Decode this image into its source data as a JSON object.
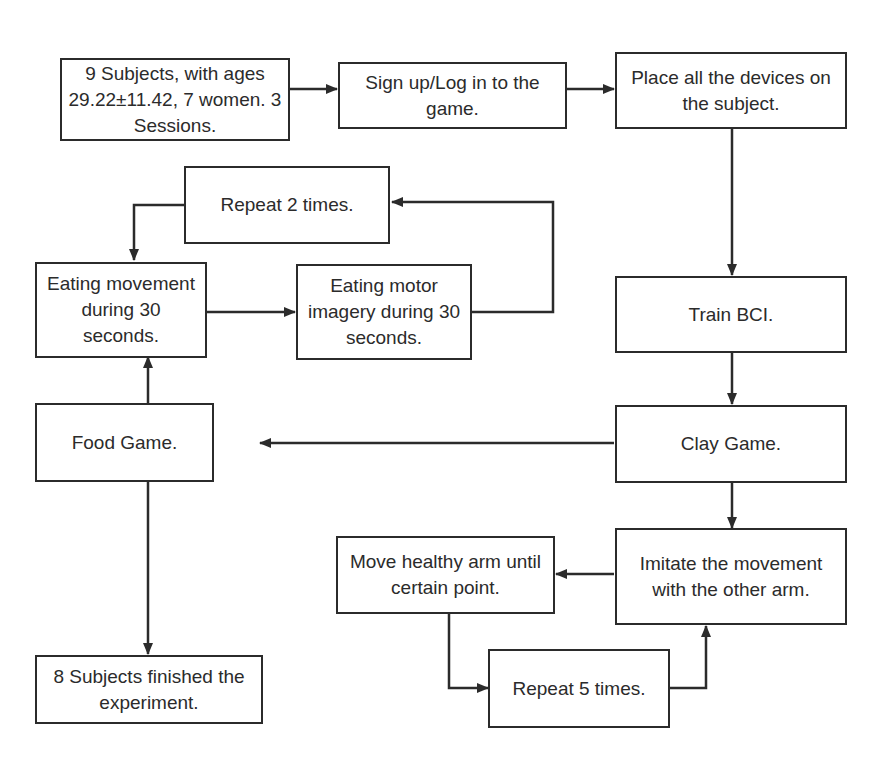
{
  "diagram": {
    "type": "flowchart",
    "nodes": {
      "subjects": "9 Subjects, with ages 29.22±11.42, 7 women. 3 Sessions.",
      "signup": "Sign up/Log in to the game.",
      "devices": "Place all the devices on the subject.",
      "train_bci": "Train BCI.",
      "clay_game": "Clay Game.",
      "imitate": "Imitate the movement with the other arm.",
      "move_arm": "Move healthy arm until certain point.",
      "repeat5": "Repeat 5 times.",
      "food_game": "Food Game.",
      "eating_movement": "Eating movement during 30 seconds.",
      "eating_imagery": "Eating motor imagery during 30 seconds.",
      "repeat2": "Repeat 2 times.",
      "finished": "8 Subjects finished the experiment."
    },
    "edges": [
      [
        "subjects",
        "signup"
      ],
      [
        "signup",
        "devices"
      ],
      [
        "devices",
        "train_bci"
      ],
      [
        "train_bci",
        "clay_game"
      ],
      [
        "clay_game",
        "imitate"
      ],
      [
        "imitate",
        "move_arm"
      ],
      [
        "move_arm",
        "repeat5"
      ],
      [
        "repeat5",
        "imitate"
      ],
      [
        "clay_game",
        "food_game"
      ],
      [
        "food_game",
        "eating_movement"
      ],
      [
        "eating_movement",
        "eating_imagery"
      ],
      [
        "eating_imagery",
        "repeat2"
      ],
      [
        "repeat2",
        "eating_movement"
      ],
      [
        "food_game",
        "finished"
      ]
    ]
  }
}
